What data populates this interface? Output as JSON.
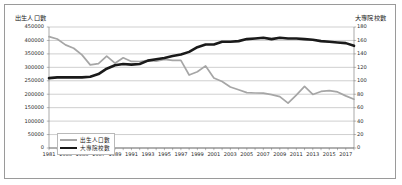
{
  "chart_data": {
    "type": "line",
    "title": "",
    "xlabel": "",
    "ylabel": "出生人口數",
    "y2label": "大專院校數",
    "grid": true,
    "legend_position": "inside-bottom-left",
    "ylim": [
      0,
      450000
    ],
    "y2lim": [
      0,
      180
    ],
    "ytick_step": 50000,
    "y2tick_step": 20,
    "xlim": [
      1981,
      2018
    ],
    "xtick_step": 2,
    "x": [
      1981,
      1982,
      1983,
      1984,
      1985,
      1986,
      1987,
      1988,
      1989,
      1990,
      1991,
      1992,
      1993,
      1994,
      1995,
      1996,
      1997,
      1998,
      1999,
      2000,
      2001,
      2002,
      2003,
      2004,
      2005,
      2006,
      2007,
      2008,
      2009,
      2010,
      2011,
      2012,
      2013,
      2014,
      2015,
      2016,
      2017,
      2018
    ],
    "yticks_left": [
      "450000",
      "400000",
      "350000",
      "300000",
      "250000",
      "200000",
      "150000",
      "100000",
      "50000",
      "0"
    ],
    "yticks_right": [
      "180",
      "160",
      "140",
      "120",
      "100",
      "80",
      "60",
      "40",
      "20",
      "0"
    ],
    "xticks": [
      "1981",
      "1983",
      "1985",
      "1987",
      "1989",
      "1991",
      "1993",
      "1995",
      "1997",
      "1999",
      "2001",
      "2003",
      "2005",
      "2007",
      "2009",
      "2011",
      "2013",
      "2015",
      "2017"
    ],
    "series": [
      {
        "name": "出生人口數",
        "axis": "left",
        "color": "#a6a6a6",
        "width": 1.7,
        "values": [
          414069,
          405263,
          383439,
          371008,
          346208,
          309230,
          314024,
          342031,
          315299,
          335618,
          321932,
          321632,
          325613,
          322938,
          329581,
          325545,
          326002,
          271450,
          283661,
          305312,
          260354,
          247530,
          227070,
          216419,
          205854,
          204459,
          204414,
          198733,
          191310,
          166886,
          196627,
          229481,
          199113,
          210383,
          213598,
          208440,
          193844,
          181601
        ]
      },
      {
        "name": "大專院校數",
        "axis": "right",
        "color": "#1a1a1a",
        "width": 2.6,
        "values": [
          104,
          105,
          105,
          105,
          105,
          106,
          110,
          118,
          123,
          125,
          124,
          125,
          130,
          132,
          134,
          137,
          139,
          143,
          150,
          154,
          154,
          158,
          158,
          159,
          162,
          163,
          164,
          162,
          164,
          163,
          163,
          162,
          161,
          159,
          158,
          157,
          156,
          152
        ]
      }
    ]
  },
  "legend": {
    "items": [
      {
        "label": "出生人口數"
      },
      {
        "label": "大專院校數"
      }
    ]
  }
}
